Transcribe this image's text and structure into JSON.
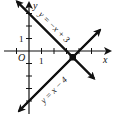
{
  "diagram": {
    "type": "coordinate-plane",
    "axes": {
      "x_label": "x",
      "y_label": "y",
      "origin_label": "O",
      "unit_label_x": "1",
      "unit_label_y": "1"
    },
    "lines": [
      {
        "equation": "y = -x + 3",
        "label": "y = −x + 3"
      },
      {
        "equation": "y = x − 4",
        "label": "y = x − 4"
      }
    ],
    "intersection": {
      "x": 3.5,
      "y": -0.5
    },
    "colors": {
      "stroke": "#111111",
      "background": "#ffffff"
    }
  }
}
